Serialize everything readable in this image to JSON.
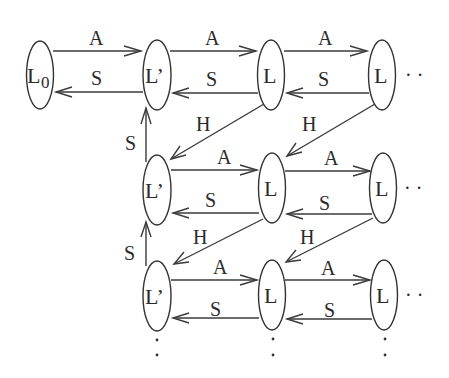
{
  "diagram": {
    "type": "state-transition-graph",
    "colors": {
      "stroke": "#333333",
      "text": "#2a2a2a",
      "background": "#ffffff"
    },
    "nodes": [
      {
        "id": "n00",
        "label": "L",
        "subscript": "0",
        "row": 0,
        "col": 0
      },
      {
        "id": "n01",
        "label": "L’",
        "row": 0,
        "col": 1
      },
      {
        "id": "n02",
        "label": "L",
        "row": 0,
        "col": 2
      },
      {
        "id": "n03",
        "label": "L",
        "row": 0,
        "col": 3
      },
      {
        "id": "n11",
        "label": "L’",
        "row": 1,
        "col": 1
      },
      {
        "id": "n12",
        "label": "L",
        "row": 1,
        "col": 2
      },
      {
        "id": "n13",
        "label": "L",
        "row": 1,
        "col": 3
      },
      {
        "id": "n21",
        "label": "L’",
        "row": 2,
        "col": 1
      },
      {
        "id": "n22",
        "label": "L",
        "row": 2,
        "col": 2
      },
      {
        "id": "n23",
        "label": "L",
        "row": 2,
        "col": 3
      }
    ],
    "edges": [
      {
        "from": "n00",
        "to": "n01",
        "label": "A"
      },
      {
        "from": "n01",
        "to": "n00",
        "label": "S"
      },
      {
        "from": "n01",
        "to": "n02",
        "label": "A"
      },
      {
        "from": "n02",
        "to": "n01",
        "label": "S"
      },
      {
        "from": "n02",
        "to": "n03",
        "label": "A"
      },
      {
        "from": "n03",
        "to": "n02",
        "label": "S"
      },
      {
        "from": "n02",
        "to": "n11",
        "label": "H"
      },
      {
        "from": "n03",
        "to": "n12",
        "label": "H"
      },
      {
        "from": "n11",
        "to": "n01",
        "label": "S"
      },
      {
        "from": "n11",
        "to": "n12",
        "label": "A"
      },
      {
        "from": "n12",
        "to": "n11",
        "label": "S"
      },
      {
        "from": "n12",
        "to": "n13",
        "label": "A"
      },
      {
        "from": "n13",
        "to": "n12",
        "label": "S"
      },
      {
        "from": "n12",
        "to": "n21",
        "label": "H"
      },
      {
        "from": "n13",
        "to": "n22",
        "label": "H"
      },
      {
        "from": "n21",
        "to": "n11",
        "label": "S"
      },
      {
        "from": "n21",
        "to": "n22",
        "label": "A"
      },
      {
        "from": "n22",
        "to": "n21",
        "label": "S"
      },
      {
        "from": "n22",
        "to": "n23",
        "label": "A"
      },
      {
        "from": "n23",
        "to": "n22",
        "label": "S"
      }
    ],
    "labels": {
      "L0": "L",
      "L0_sub": "0",
      "Lprime": "L’",
      "L": "L",
      "A": "A",
      "S": "S",
      "H": "H",
      "ellipsis_h": "· ·",
      "ellipsis_v": ":"
    }
  }
}
